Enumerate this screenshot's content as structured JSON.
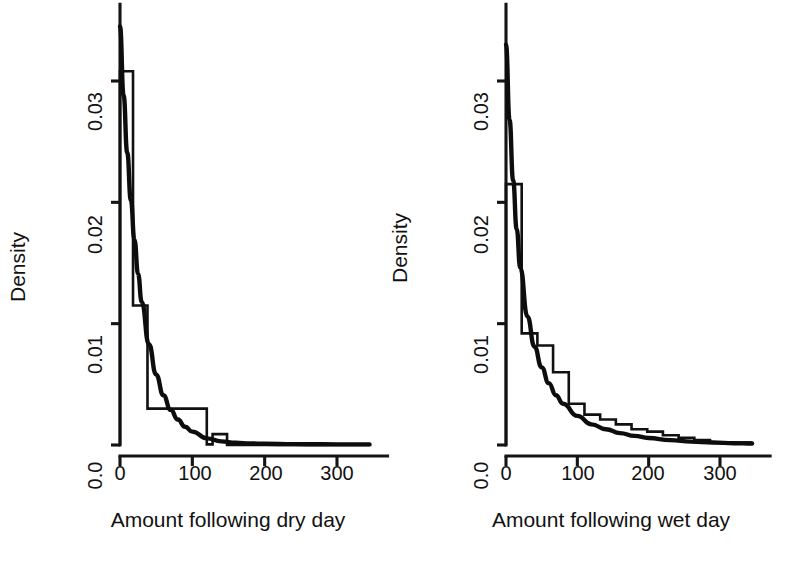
{
  "figure": {
    "background": "#ffffff",
    "ink_color": "#111111",
    "panel_count": 2
  },
  "chart_data": [
    {
      "type": "histogram",
      "panel": "left",
      "title": "",
      "xlabel": "Amount following dry day",
      "ylabel": "Density",
      "xlim": [
        -8,
        345
      ],
      "ylim": [
        -0.0012,
        0.0345
      ],
      "xticks": [
        0,
        100,
        200,
        300
      ],
      "xticklabels": [
        "0",
        "100",
        "200",
        "300"
      ],
      "yticks": [
        0.0,
        0.01,
        0.02,
        0.03
      ],
      "yticklabels": [
        "0.0",
        "0.01",
        "0.02",
        "0.03"
      ],
      "grid": false,
      "legend": "none",
      "bin_edges": [
        0,
        18,
        38,
        58,
        78,
        98,
        118,
        128,
        148,
        168,
        345
      ],
      "bin_densities": [
        0.0308,
        0.0115,
        0.0115,
        0.003,
        0.003,
        0.003,
        0.0005,
        0.0005,
        0.0,
        0.0
      ],
      "series": [
        {
          "name": "histogram-step-outline",
          "style": "step",
          "x": [
            0,
            0,
            18,
            18,
            38,
            38,
            58,
            58,
            120,
            120,
            128,
            128,
            148,
            148,
            345
          ],
          "y": [
            0.0,
            0.0308,
            0.0308,
            0.0115,
            0.0115,
            0.003,
            0.003,
            0.003,
            0.003,
            5e-05,
            5e-05,
            0.0009,
            0.0009,
            0.0,
            0.0
          ]
        },
        {
          "name": "fitted-exponential-density",
          "style": "smooth-curve",
          "x": [
            0,
            5,
            10,
            15,
            20,
            25,
            30,
            40,
            50,
            60,
            70,
            80,
            90,
            100,
            120,
            140,
            160,
            180,
            200,
            240,
            280,
            320,
            345
          ],
          "y": [
            0.0345,
            0.0288,
            0.0241,
            0.0202,
            0.0169,
            0.0141,
            0.0118,
            0.0083,
            0.0058,
            0.0041,
            0.0029,
            0.0021,
            0.0015,
            0.0011,
            0.00055,
            0.0003,
            0.00018,
            0.00013,
            0.0001,
            7e-05,
            6e-05,
            5e-05,
            5e-05
          ]
        }
      ]
    },
    {
      "type": "histogram",
      "panel": "right",
      "title": "",
      "xlabel": "Amount following wet day",
      "ylabel": "Density",
      "xlim": [
        -8,
        345
      ],
      "ylim": [
        -0.0012,
        0.0345
      ],
      "xticks": [
        0,
        100,
        200,
        300
      ],
      "xticklabels": [
        "0",
        "100",
        "200",
        "300"
      ],
      "yticks": [
        0.0,
        0.01,
        0.02,
        0.03
      ],
      "yticklabels": [
        "0.0",
        "0.01",
        "0.02",
        "0.03"
      ],
      "grid": false,
      "legend": "none",
      "bin_edges": [
        0,
        22,
        44,
        66,
        88,
        110,
        132,
        154,
        176,
        198,
        220,
        242,
        264,
        286,
        308,
        345
      ],
      "bin_densities": [
        0.0215,
        0.0092,
        0.0082,
        0.006,
        0.0034,
        0.0025,
        0.0021,
        0.0017,
        0.0013,
        0.0011,
        0.0008,
        0.0006,
        0.0004,
        0.0003,
        0.0002
      ],
      "series": [
        {
          "name": "histogram-step-outline",
          "style": "step",
          "x": [
            0,
            0,
            22,
            22,
            44,
            44,
            66,
            66,
            88,
            88,
            110,
            110,
            132,
            132,
            154,
            154,
            176,
            176,
            198,
            198,
            220,
            220,
            242,
            242,
            264,
            264,
            286,
            286,
            345
          ],
          "y": [
            0.0,
            0.0215,
            0.0215,
            0.0092,
            0.0092,
            0.0082,
            0.0082,
            0.006,
            0.006,
            0.0034,
            0.0034,
            0.0025,
            0.0025,
            0.0021,
            0.0021,
            0.0017,
            0.0017,
            0.0013,
            0.0013,
            0.0011,
            0.0011,
            0.0008,
            0.0008,
            0.0006,
            0.0006,
            0.0004,
            0.0004,
            0.0002,
            0.0002
          ]
        },
        {
          "name": "fitted-exponential-density",
          "style": "smooth-curve",
          "x": [
            0,
            5,
            10,
            15,
            20,
            30,
            40,
            50,
            60,
            70,
            80,
            100,
            120,
            140,
            160,
            180,
            200,
            230,
            260,
            290,
            320,
            345
          ],
          "y": [
            0.033,
            0.0268,
            0.0218,
            0.0178,
            0.0146,
            0.0106,
            0.0081,
            0.0064,
            0.0051,
            0.0041,
            0.0034,
            0.0024,
            0.0017,
            0.0013,
            0.00098,
            0.00075,
            0.00058,
            0.0004,
            0.00028,
            0.0002,
            0.00015,
            0.00012
          ]
        }
      ]
    }
  ]
}
